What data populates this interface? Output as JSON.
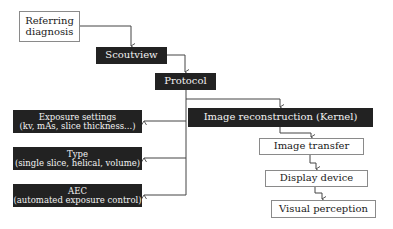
{
  "nodes": {
    "referring": {
      "line1": "Referring",
      "line2": "diagnosis"
    },
    "scoutview": {
      "label": "Scoutview"
    },
    "protocol": {
      "label": "Protocol"
    },
    "reconstruction": {
      "label": "Image reconstruction (Kernel)"
    },
    "transfer": {
      "label": "Image transfer"
    },
    "display": {
      "label": "Display device"
    },
    "perception": {
      "label": "Visual perception"
    },
    "exposure": {
      "line1": "Exposure settings",
      "line2": "(kv, mAs, slice thickness...)"
    },
    "type": {
      "line1": "Type",
      "line2": "(single slice, helical, volume)"
    },
    "aec": {
      "line1": "AEC",
      "line2": "(automated exposure control)"
    }
  },
  "colors": {
    "dark_box": "#222222",
    "light_box": "#ffffff",
    "line": "#444444"
  }
}
